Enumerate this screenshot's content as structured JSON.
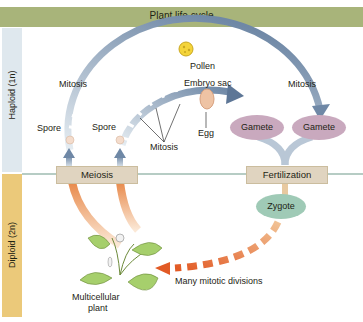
{
  "title": "Plant life cycle",
  "bands": {
    "haploid": "Haploid (1n)",
    "diploid": "Diploid (2n)"
  },
  "labels": {
    "pollen": "Pollen",
    "embryo_sac": "Embryo sac",
    "mitosis_left": "Mitosis",
    "mitosis_right": "Mitosis",
    "mitosis_center": "Mitosis",
    "egg": "Egg",
    "spore_left": "Spore",
    "spore_right": "Spore",
    "many_mitotic": "Many mitotic divisions",
    "multicellular_1": "Multicellular",
    "multicellular_2": "plant"
  },
  "boxes": {
    "meiosis": "Meiosis",
    "fertilization": "Fertilization"
  },
  "ovals": {
    "gamete_1": "Gamete",
    "gamete_2": "Gamete",
    "zygote": "Zygote"
  },
  "colors": {
    "title_bar": "#a8b47a",
    "haploid_band": "#dfe8ee",
    "diploid_band": "#ebc97a",
    "haploid_arrow": "#6f88a6",
    "diploid_arrow": "#e8894a",
    "gamete": "#c9a9be",
    "zygote": "#9fcab6",
    "box": "#e0d4c0",
    "divider": "#6f9a8a"
  }
}
